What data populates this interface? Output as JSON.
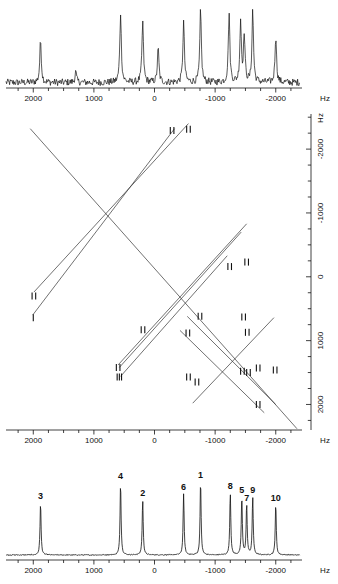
{
  "figure": {
    "unit": "Hz"
  },
  "top_spectrum": {
    "name": "projection-spectrum",
    "axis": {
      "ticks": [
        2000,
        1000,
        0,
        -1000,
        -2000
      ],
      "tick_labels": [
        "2000",
        "1000",
        "0",
        "-1000",
        "-2000"
      ],
      "unit": "Hz",
      "min": -2400,
      "max": 2450,
      "minor_tick_step": 250
    },
    "noisy": true,
    "peaks": [
      {
        "hz": 1880,
        "height": 0.56
      },
      {
        "hz": 1300,
        "height": 0.14
      },
      {
        "hz": 560,
        "height": 0.92
      },
      {
        "hz": 195,
        "height": 0.8
      },
      {
        "hz": -60,
        "height": 0.45
      },
      {
        "hz": -480,
        "height": 0.8
      },
      {
        "hz": -760,
        "height": 0.95
      },
      {
        "hz": -1230,
        "height": 0.92
      },
      {
        "hz": -1420,
        "height": 0.8
      },
      {
        "hz": -1480,
        "height": 0.62
      },
      {
        "hz": -1620,
        "height": 0.95
      },
      {
        "hz": -2000,
        "height": 0.62
      }
    ]
  },
  "correlation_map": {
    "name": "2d-correlation-plot",
    "x_axis": {
      "ticks": [
        2000,
        1000,
        0,
        -1000,
        -2000
      ],
      "tick_labels": [
        "2000",
        "1000",
        "0",
        "-1000",
        "-2000"
      ],
      "unit": "Hz",
      "min": -2400,
      "max": 2450,
      "minor_tick_step": 250
    },
    "y_axis": {
      "ticks": [
        -2000,
        -1000,
        0,
        1000,
        2000
      ],
      "tick_labels": [
        "-2000",
        "-1000",
        "0",
        "1000",
        "2000"
      ],
      "unit": "Hz",
      "min": -2550,
      "max": 2400,
      "minor_tick_step": 250,
      "position": "right"
    },
    "lines": [
      {
        "x1": 2050,
        "y1": -2320,
        "x2": -2350,
        "y2": 2380
      },
      {
        "x1": 1990,
        "y1": 240,
        "x2": -560,
        "y2": -2400
      },
      {
        "x1": 2010,
        "y1": 600,
        "x2": -330,
        "y2": -2320
      },
      {
        "x1": 600,
        "y1": 1380,
        "x2": -1520,
        "y2": -830
      },
      {
        "x1": 580,
        "y1": 1420,
        "x2": -1430,
        "y2": -700
      },
      {
        "x1": 560,
        "y1": 1560,
        "x2": -1200,
        "y2": -330
      },
      {
        "x1": -540,
        "y1": 620,
        "x2": -2000,
        "y2": 2000
      },
      {
        "x1": -420,
        "y1": 840,
        "x2": -1810,
        "y2": 2130
      },
      {
        "x1": -630,
        "y1": 1980,
        "x2": -1970,
        "y2": 640
      }
    ],
    "markers": [
      {
        "hz_x": 1990,
        "hz_y": 300,
        "kind": "doublet"
      },
      {
        "hz_x": 2000,
        "hz_y": 640,
        "kind": "singlet"
      },
      {
        "hz_x": -290,
        "hz_y": -2290,
        "kind": "doublet"
      },
      {
        "hz_x": -560,
        "hz_y": -2310,
        "kind": "doublet"
      },
      {
        "hz_x": 600,
        "hz_y": 1420,
        "kind": "doublet"
      },
      {
        "hz_x": 580,
        "hz_y": 1570,
        "kind": "multiplet"
      },
      {
        "hz_x": -1240,
        "hz_y": -160,
        "kind": "doublet"
      },
      {
        "hz_x": -1520,
        "hz_y": -230,
        "kind": "doublet"
      },
      {
        "hz_x": 190,
        "hz_y": 830,
        "kind": "doublet"
      },
      {
        "hz_x": -550,
        "hz_y": 880,
        "kind": "doublet"
      },
      {
        "hz_x": -750,
        "hz_y": 620,
        "kind": "doublet"
      },
      {
        "hz_x": -1470,
        "hz_y": 630,
        "kind": "doublet"
      },
      {
        "hz_x": -1530,
        "hz_y": 870,
        "kind": "doublet"
      },
      {
        "hz_x": -560,
        "hz_y": 1570,
        "kind": "doublet"
      },
      {
        "hz_x": -700,
        "hz_y": 1650,
        "kind": "doublet"
      },
      {
        "hz_x": -1450,
        "hz_y": 1480,
        "kind": "doublet"
      },
      {
        "hz_x": -1710,
        "hz_y": 1430,
        "kind": "doublet"
      },
      {
        "hz_x": -1550,
        "hz_y": 1500,
        "kind": "doublet"
      },
      {
        "hz_x": -1990,
        "hz_y": 1460,
        "kind": "doublet"
      },
      {
        "hz_x": -1710,
        "hz_y": 2000,
        "kind": "doublet"
      }
    ]
  },
  "bottom_spectrum": {
    "name": "assigned-spectrum",
    "axis": {
      "ticks": [
        2000,
        1000,
        0,
        -1000,
        -2000
      ],
      "tick_labels": [
        "2000",
        "1000",
        "0",
        "-1000",
        "-2000"
      ],
      "unit": "Hz",
      "min": -2400,
      "max": 2450,
      "minor_tick_step": 250
    },
    "peaks": [
      {
        "label": "3",
        "hz": 1880,
        "height": 0.7
      },
      {
        "label": "4",
        "hz": 560,
        "height": 0.97
      },
      {
        "label": "2",
        "hz": 195,
        "height": 0.74
      },
      {
        "label": "6",
        "hz": -480,
        "height": 0.82
      },
      {
        "label": "1",
        "hz": -760,
        "height": 0.99
      },
      {
        "label": "8",
        "hz": -1250,
        "height": 0.84
      },
      {
        "label": "5",
        "hz": -1440,
        "height": 0.78
      },
      {
        "label": "7",
        "hz": -1520,
        "height": 0.68
      },
      {
        "label": "9",
        "hz": -1620,
        "height": 0.78
      },
      {
        "label": "10",
        "hz": -2000,
        "height": 0.68
      }
    ]
  }
}
